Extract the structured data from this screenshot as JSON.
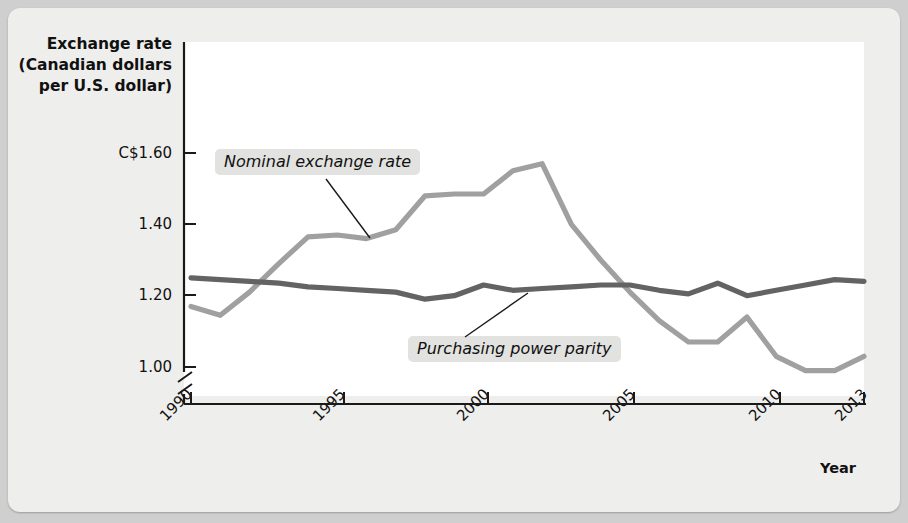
{
  "figure": {
    "background_color": "#eeeeec",
    "plot_background_color": "#ffffff"
  },
  "axes": {
    "y_axis_title_lines": [
      "Exchange rate",
      "(Canadian dollars",
      "per U.S. dollar)"
    ],
    "y_tick_labels": [
      "C$1.60",
      "1.40",
      "1.20",
      "1.00"
    ],
    "x_axis_title": "Year",
    "x_tick_labels": [
      "1990",
      "1995",
      "2000",
      "2005",
      "2010",
      "2013"
    ],
    "axis_break": true
  },
  "annotations": {
    "nominal_label": "Nominal exchange rate",
    "ppp_label": "Purchasing power parity"
  },
  "colors": {
    "nominal_line": "#a0a0a0",
    "ppp_line": "#636363",
    "axis": "#1a1a1a",
    "label_chip": "#e2e2e0"
  },
  "chart_data": {
    "type": "line",
    "title": "",
    "xlabel": "Year",
    "ylabel": "Exchange rate (Canadian dollars per U.S. dollar)",
    "xlim": [
      1990,
      2013
    ],
    "ylim": [
      0.92,
      1.68
    ],
    "ytick_values": [
      1.6,
      1.4,
      1.2,
      1.0
    ],
    "xtick_values": [
      1990,
      1995,
      2000,
      2005,
      2010,
      2013
    ],
    "grid": false,
    "legend": "inline-annotations",
    "axis_break_below": 1.0,
    "x": [
      1990,
      1991,
      1992,
      1993,
      1994,
      1995,
      1996,
      1997,
      1998,
      1999,
      2000,
      2001,
      2002,
      2003,
      2004,
      2005,
      2006,
      2007,
      2008,
      2009,
      2010,
      2011,
      2012,
      2013
    ],
    "series": [
      {
        "name": "Nominal exchange rate",
        "color": "#a0a0a0",
        "values": [
          1.17,
          1.145,
          1.21,
          1.29,
          1.365,
          1.37,
          1.36,
          1.385,
          1.48,
          1.485,
          1.485,
          1.55,
          1.57,
          1.4,
          1.3,
          1.21,
          1.13,
          1.07,
          1.07,
          1.14,
          1.03,
          0.99,
          0.99,
          1.03
        ]
      },
      {
        "name": "Purchasing power parity",
        "color": "#636363",
        "values": [
          1.25,
          1.245,
          1.24,
          1.235,
          1.225,
          1.22,
          1.215,
          1.21,
          1.19,
          1.2,
          1.23,
          1.215,
          1.22,
          1.225,
          1.23,
          1.23,
          1.215,
          1.205,
          1.235,
          1.2,
          1.215,
          1.23,
          1.245,
          1.24
        ]
      }
    ]
  }
}
